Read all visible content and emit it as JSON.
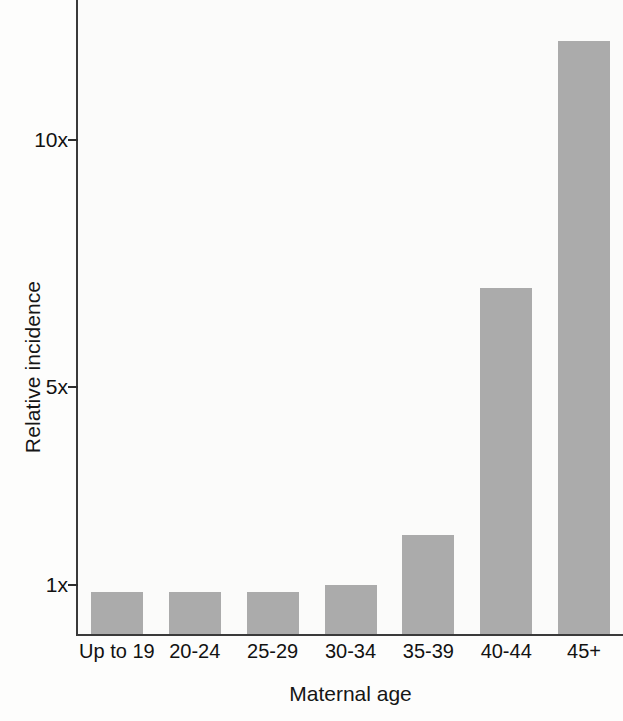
{
  "chart_data": {
    "type": "bar",
    "title": "",
    "xlabel": "Maternal age",
    "ylabel": "Relative incidence",
    "categories": [
      "Up to 19",
      "20-24",
      "25-29",
      "30-34",
      "35-39",
      "40-44",
      "45+"
    ],
    "values": [
      0.85,
      0.85,
      0.85,
      1.0,
      2.0,
      7.0,
      12.0
    ],
    "ylim": [
      0,
      12.8
    ],
    "yticks": [
      1,
      5,
      10
    ],
    "ytick_labels": [
      "1x",
      "5x",
      "10x"
    ],
    "grid": false,
    "legend": null,
    "bar_color": "#ababab",
    "axis_color": "#3a3a3a",
    "background_color": "#fdfdfc",
    "series": [
      {
        "name": "Relative incidence",
        "values": [
          0.85,
          0.85,
          0.85,
          1.0,
          2.0,
          7.0,
          12.0
        ]
      }
    ]
  }
}
